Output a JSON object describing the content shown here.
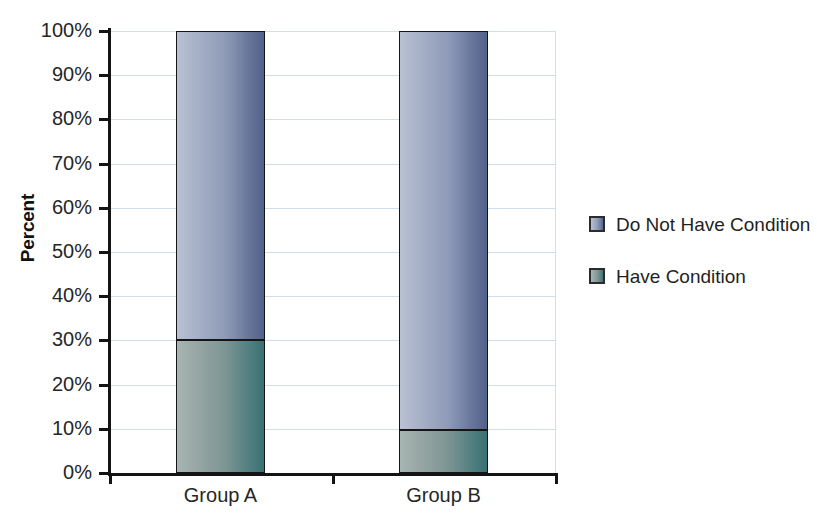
{
  "chart_data": {
    "type": "bar",
    "subtype": "stacked-100-percent",
    "title": "",
    "xlabel": "",
    "ylabel": "Percent",
    "categories": [
      "Group A",
      "Group B"
    ],
    "series": [
      {
        "name": "Do Not Have Condition",
        "values": [
          70,
          90.2
        ],
        "color": "#8f9bb8"
      },
      {
        "name": "Have Condition",
        "values": [
          30,
          9.8
        ],
        "color": "#7e9594"
      }
    ],
    "ylim": [
      0,
      100
    ],
    "ytick_labels": [
      "0%",
      "10%",
      "20%",
      "30%",
      "40%",
      "50%",
      "60%",
      "70%",
      "80%",
      "90%",
      "100%"
    ],
    "ytick_values": [
      0,
      10,
      20,
      30,
      40,
      50,
      60,
      70,
      80,
      90,
      100
    ],
    "grid": true,
    "gridline_color": "#cfe0ec",
    "legend_position": "right",
    "axis_color": "#141414",
    "background": "#ffffff"
  },
  "axis": {
    "y_title": "Percent"
  },
  "legend": {
    "items": [
      {
        "label": "Do Not Have Condition"
      },
      {
        "label": "Have Condition"
      }
    ]
  }
}
